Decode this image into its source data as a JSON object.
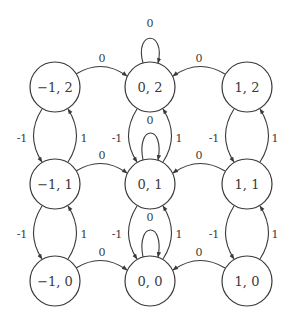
{
  "diagram": {
    "type": "state-transition-graph",
    "colors": {
      "stroke": "#3a3a3a",
      "background": "#ffffff"
    },
    "nodes": [
      {
        "id": "n_m1_2",
        "label": "−1, 2",
        "x": 55,
        "y": 87
      },
      {
        "id": "n_0_2",
        "label": "0, 2",
        "x": 150,
        "y": 87
      },
      {
        "id": "n_1_2",
        "label": "1, 2",
        "x": 247,
        "y": 87
      },
      {
        "id": "n_m1_1",
        "label": "−1, 1",
        "x": 55,
        "y": 184
      },
      {
        "id": "n_0_1",
        "label": "0, 1",
        "x": 150,
        "y": 184
      },
      {
        "id": "n_1_1",
        "label": "1, 1",
        "x": 247,
        "y": 184
      },
      {
        "id": "n_m1_0",
        "label": "−1, 0",
        "x": 55,
        "y": 281
      },
      {
        "id": "n_0_0",
        "label": "0, 0",
        "x": 150,
        "y": 281
      },
      {
        "id": "n_1_0",
        "label": "1, 0",
        "x": 247,
        "y": 281
      }
    ],
    "edges": [
      {
        "from": "-1,2",
        "to": "0,2",
        "label": "0"
      },
      {
        "from": "1,2",
        "to": "0,2",
        "label": "0"
      },
      {
        "from": "0,2",
        "to": "0,2",
        "label": "0"
      },
      {
        "from": "-1,1",
        "to": "0,1",
        "label": "0"
      },
      {
        "from": "1,1",
        "to": "0,1",
        "label": "0"
      },
      {
        "from": "0,1",
        "to": "0,1",
        "label": "0"
      },
      {
        "from": "-1,0",
        "to": "0,0",
        "label": "0"
      },
      {
        "from": "1,0",
        "to": "0,0",
        "label": "0"
      },
      {
        "from": "0,0",
        "to": "0,0",
        "label": "0"
      },
      {
        "from": "-1,2",
        "to": "-1,1",
        "label": "-1"
      },
      {
        "from": "-1,1",
        "to": "-1,2",
        "label": "1"
      },
      {
        "from": "0,2",
        "to": "0,1",
        "label": "-1"
      },
      {
        "from": "0,1",
        "to": "0,2",
        "label": "1"
      },
      {
        "from": "1,2",
        "to": "1,1",
        "label": "-1"
      },
      {
        "from": "1,1",
        "to": "1,2",
        "label": "1"
      },
      {
        "from": "-1,1",
        "to": "-1,0",
        "label": "-1"
      },
      {
        "from": "-1,0",
        "to": "-1,1",
        "label": "1"
      },
      {
        "from": "0,1",
        "to": "0,0",
        "label": "-1"
      },
      {
        "from": "0,0",
        "to": "0,1",
        "label": "1"
      },
      {
        "from": "1,1",
        "to": "1,0",
        "label": "-1"
      },
      {
        "from": "1,0",
        "to": "1,1",
        "label": "1"
      }
    ],
    "labels": {
      "zero": "0",
      "minus_one": "-1",
      "one": "1"
    }
  }
}
